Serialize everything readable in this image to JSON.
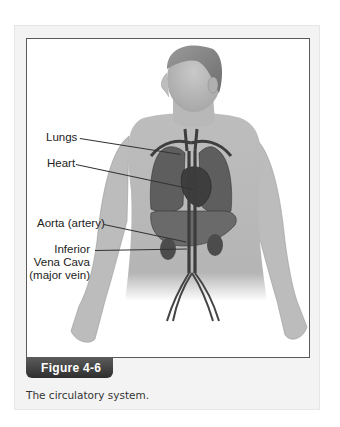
{
  "figure": {
    "number_label": "Figure 4-6",
    "caption": "The circulatory system.",
    "labels": {
      "lungs": "Lungs",
      "heart": "Heart",
      "aorta": "Aorta (artery)",
      "ivc_line1": "Inferior",
      "ivc_line2": "Vena Cava",
      "ivc_line3": "(major vein)"
    }
  }
}
